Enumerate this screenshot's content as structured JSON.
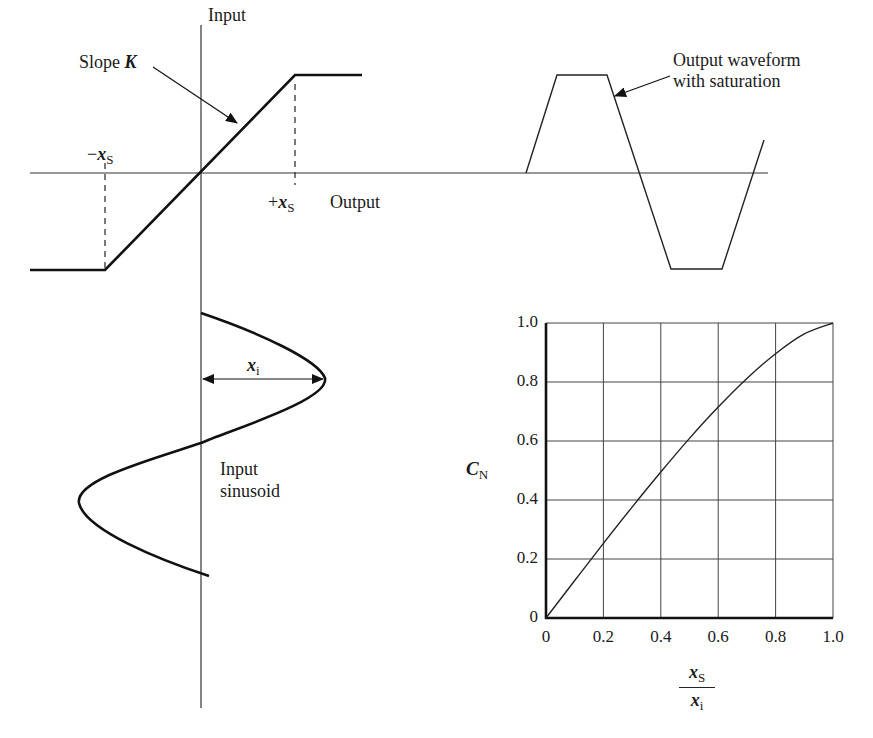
{
  "transfer_diagram": {
    "input_axis_label": "Input",
    "output_axis_label": "Output",
    "slope_label_prefix": "Slope ",
    "slope_symbol": "K",
    "neg_threshold_sign": "−",
    "pos_threshold_sign": "+",
    "threshold_symbol": "x",
    "threshold_subscript": "S"
  },
  "output_waveform": {
    "label_line1": "Output waveform",
    "label_line2": "with saturation"
  },
  "input_sinusoid": {
    "amplitude_symbol": "x",
    "amplitude_subscript": "i",
    "label_line1": "Input",
    "label_line2": "sinusoid"
  },
  "chart_data": {
    "type": "line",
    "title": "",
    "xlabel": "x_S / x_i",
    "ylabel": "C_N",
    "xlim": [
      0,
      1.0
    ],
    "ylim": [
      0,
      1.0
    ],
    "grid": true,
    "legend": "none",
    "x_ticks": [
      "0",
      "0.2",
      "0.4",
      "0.6",
      "0.8",
      "1.0"
    ],
    "y_ticks": [
      "0",
      "0.2",
      "0.4",
      "0.6",
      "0.8",
      "1.0"
    ],
    "series": [
      {
        "name": "C_N",
        "x": [
          0,
          0.1,
          0.2,
          0.3,
          0.4,
          0.5,
          0.6,
          0.7,
          0.8,
          0.9,
          1.0
        ],
        "values": [
          0,
          0.127,
          0.253,
          0.376,
          0.495,
          0.609,
          0.715,
          0.812,
          0.896,
          0.963,
          1.0
        ]
      }
    ],
    "ylabel_symbol": "C",
    "ylabel_subscript": "N",
    "xlabel_num_symbol": "x",
    "xlabel_num_subscript": "S",
    "xlabel_den_symbol": "x",
    "xlabel_den_subscript": "i"
  }
}
